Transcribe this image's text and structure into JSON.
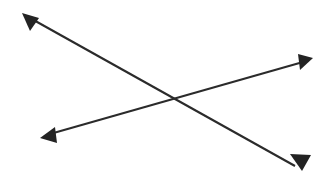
{
  "figure": {
    "type": "line-diagram",
    "title": "",
    "width": 324,
    "height": 175,
    "background_color": "#ffffff",
    "stroke_color": "#2b2b2b",
    "head_color": "#232323",
    "stroke_width": 2.1,
    "intersection": {
      "x": 177,
      "y": 100
    },
    "arrows": [
      {
        "name": "arrow-descending",
        "label": "",
        "orientation": "top-left to bottom-right",
        "start": {
          "x": 22,
          "y": 13
        },
        "end": {
          "x": 302,
          "y": 170
        },
        "start_head": true,
        "end_head": true,
        "path": "M 30 18 L 295 166",
        "head_start_points": "22,13 39,18 30,31",
        "head_end_points": "302,171 290,154 311,155"
      },
      {
        "name": "arrow-ascending",
        "label": "",
        "orientation": "bottom-left to top-right",
        "start": {
          "x": 41,
          "y": 137
        },
        "end": {
          "x": 312,
          "y": 59
        },
        "start_head": true,
        "end_head": true,
        "path": "M 50 134 L 303 62",
        "head_start_points": "40,138 55,127 57,143"
      }
    ]
  }
}
